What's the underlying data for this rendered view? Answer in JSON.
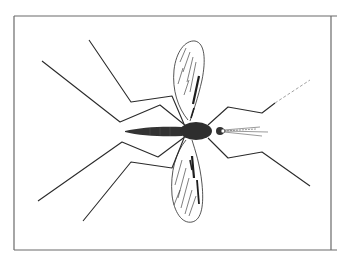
{
  "figure": {
    "alt": "Line drawing of a mosquito, top view, with wings spread and six long legs",
    "colors": {
      "background": "#ffffff",
      "frame": "#6a6a6a",
      "ink": "#2a2a2a",
      "body": "#333333"
    }
  }
}
